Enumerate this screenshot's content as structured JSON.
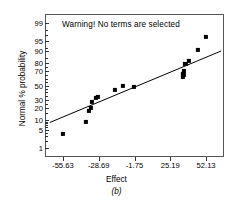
{
  "chart_data": {
    "type": "scatter",
    "title": "Warning! No terms are selected",
    "xlabel": "Effect",
    "ylabel": "Normal % probability",
    "caption": "(b)",
    "xlim": [
      -69.1,
      65.6
    ],
    "xticks": [
      -55.63,
      -28.69,
      -1.75,
      25.19,
      52.13
    ],
    "xticklabels": [
      "-55.63",
      "-28.69",
      "-1.75",
      "25.19",
      "52.13"
    ],
    "yscale": "probit",
    "yticks": [
      1,
      5,
      10,
      20,
      30,
      50,
      70,
      80,
      90,
      95,
      99
    ],
    "yticklabels": [
      "1",
      "5",
      "10",
      "20",
      "30",
      "50",
      "70",
      "80",
      "90",
      "95",
      "99"
    ],
    "ylim": [
      0.4,
      99.6
    ],
    "grid": false,
    "legend": null,
    "marker": "filled-square",
    "marker_color": "#000000",
    "points": [
      {
        "x": -55.6,
        "y": 3.6
      },
      {
        "x": -38.1,
        "y": 9.0
      },
      {
        "x": -36.2,
        "y": 17.5
      },
      {
        "x": -34.3,
        "y": 20.5
      },
      {
        "x": -33.6,
        "y": 27.0
      },
      {
        "x": -30.7,
        "y": 32.0
      },
      {
        "x": -29.4,
        "y": 34.0
      },
      {
        "x": -16.3,
        "y": 43.0
      },
      {
        "x": -10.2,
        "y": 49.5
      },
      {
        "x": -1.9,
        "y": 47.5
      },
      {
        "x": 34.6,
        "y": 62.0
      },
      {
        "x": 35.1,
        "y": 66.0
      },
      {
        "x": 35.6,
        "y": 70.5
      },
      {
        "x": 36.5,
        "y": 79.0
      },
      {
        "x": 39.2,
        "y": 82.0
      },
      {
        "x": 45.9,
        "y": 90.5
      },
      {
        "x": 51.7,
        "y": 96.5
      }
    ],
    "fit_line": {
      "x0": -65.5,
      "y0": 8.5,
      "x1": 63.5,
      "y1": 90.0
    }
  }
}
